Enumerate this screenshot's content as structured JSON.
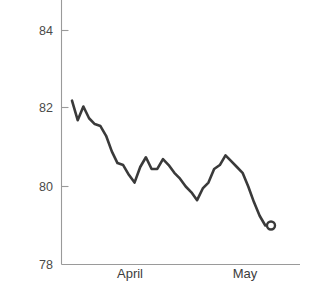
{
  "chart_data": {
    "type": "line",
    "title": "",
    "subtitle": "",
    "xlabel": "",
    "ylabel": "",
    "grid": false,
    "legend": false,
    "ylim": [
      78,
      84
    ],
    "yticks": [
      78,
      80,
      82,
      84
    ],
    "ytick_labels": [
      "78",
      "80",
      "82",
      "84"
    ],
    "xtick_labels": [
      "April",
      "May"
    ],
    "xtick_positions": [
      0.28,
      0.84
    ],
    "x_indices": [
      0,
      1,
      2,
      3,
      4,
      5,
      6,
      7,
      8,
      9,
      10,
      11,
      12,
      13,
      14,
      15,
      16,
      17,
      18,
      19,
      20,
      21,
      22,
      23,
      24,
      25,
      26,
      27,
      28,
      29,
      30,
      31,
      32,
      33,
      34,
      35
    ],
    "values": [
      82.2,
      81.7,
      82.05,
      81.75,
      81.6,
      81.55,
      81.3,
      80.9,
      80.6,
      80.55,
      80.3,
      80.1,
      80.5,
      80.75,
      80.45,
      80.45,
      80.7,
      80.55,
      80.35,
      80.2,
      80.0,
      79.85,
      79.65,
      79.95,
      80.1,
      80.45,
      80.55,
      80.8,
      80.65,
      80.5,
      80.35,
      80.0,
      79.6,
      79.25,
      79.0,
      79.0
    ],
    "end_marker": {
      "value": 79.0,
      "shape": "open-circle"
    },
    "line_color": "#3a3a3a",
    "axis_color": "#9a9a9a",
    "background_color": "#ffffff"
  }
}
